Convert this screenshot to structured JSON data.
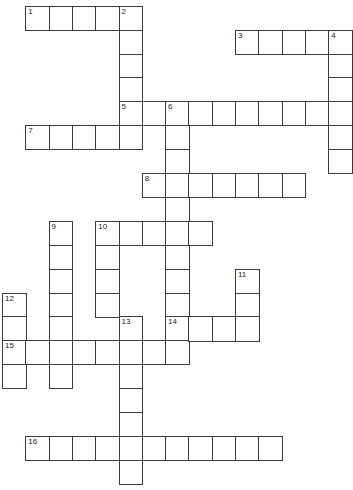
{
  "puzzle": {
    "type": "crossword",
    "grid": {
      "origin_x": 2,
      "origin_y": 5.7,
      "cell_w": 23.3,
      "cell_h": 23.9,
      "line_color": "#3a3a3a",
      "fill_color": "#ffffff"
    },
    "entries": [
      {
        "number": "1",
        "direction": "across",
        "row": 0,
        "col": 1,
        "length": 5
      },
      {
        "number": "2",
        "direction": "down",
        "row": 0,
        "col": 5,
        "length": 6
      },
      {
        "number": "3",
        "direction": "across",
        "row": 1,
        "col": 10,
        "length": 5
      },
      {
        "number": "4",
        "direction": "down",
        "row": 1,
        "col": 14,
        "length": 6
      },
      {
        "number": "5",
        "direction": "across",
        "row": 4,
        "col": 5,
        "length": 10
      },
      {
        "number": "6",
        "direction": "down",
        "row": 4,
        "col": 7,
        "length": 11
      },
      {
        "number": "7",
        "direction": "across",
        "row": 5,
        "col": 1,
        "length": 5
      },
      {
        "number": "8",
        "direction": "across",
        "row": 7,
        "col": 6,
        "length": 7
      },
      {
        "number": "9",
        "direction": "down",
        "row": 9,
        "col": 2,
        "length": 7
      },
      {
        "number": "10",
        "direction": "across",
        "row": 9,
        "col": 4,
        "length": 5
      },
      {
        "number": "10",
        "direction": "down",
        "row": 9,
        "col": 4,
        "length": 4
      },
      {
        "number": "11",
        "direction": "down",
        "row": 11,
        "col": 10,
        "length": 3
      },
      {
        "number": "12",
        "direction": "down",
        "row": 12,
        "col": 0,
        "length": 4
      },
      {
        "number": "13",
        "direction": "down",
        "row": 13,
        "col": 5,
        "length": 7
      },
      {
        "number": "14",
        "direction": "across",
        "row": 13,
        "col": 7,
        "length": 4
      },
      {
        "number": "15",
        "direction": "across",
        "row": 14,
        "col": 0,
        "length": 8
      },
      {
        "number": "16",
        "direction": "across",
        "row": 18,
        "col": 1,
        "length": 11
      }
    ]
  }
}
